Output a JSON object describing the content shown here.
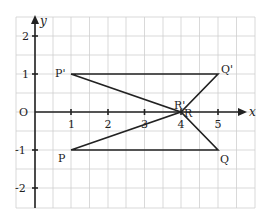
{
  "diagram": {
    "type": "coordinate-plane",
    "grid": {
      "x_min_px": 16,
      "x_max_px": 255,
      "y_min_px": 17,
      "y_max_px": 208,
      "cell_px": 18.3,
      "color": "#c8c8c8"
    },
    "axes": {
      "x_label": "x",
      "y_label": "y",
      "origin_label": "O",
      "x_ticks": [
        "1",
        "2",
        "3",
        "4",
        "5"
      ],
      "y_ticks": [
        "2",
        "1",
        "-1",
        "-2"
      ],
      "color": "#222222"
    },
    "points": [
      {
        "name": "P",
        "label": "P",
        "x": 1,
        "y": -1
      },
      {
        "name": "Q",
        "label": "Q",
        "x": 5,
        "y": -1
      },
      {
        "name": "R",
        "label": "R",
        "x": 4,
        "y": 0
      },
      {
        "name": "P_prime",
        "label": "P'",
        "x": 1,
        "y": 1
      },
      {
        "name": "Q_prime",
        "label": "Q'",
        "x": 5,
        "y": 1
      },
      {
        "name": "R_prime",
        "label": "R'",
        "x": 4,
        "y": 0
      }
    ],
    "triangles": [
      {
        "name": "PQR",
        "vertices": [
          "P",
          "Q",
          "R"
        ]
      },
      {
        "name": "P'Q'R'",
        "vertices": [
          "P'",
          "Q'",
          "R'"
        ]
      }
    ]
  }
}
